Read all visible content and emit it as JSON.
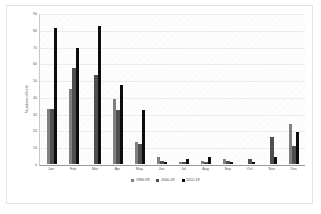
{
  "chart_data": {
    "type": "bar",
    "title": "",
    "xlabel": "",
    "ylabel": "Numbers of birth",
    "ylim": [
      0,
      90
    ],
    "yticks": [
      0,
      10,
      20,
      30,
      40,
      50,
      60,
      70,
      80,
      90
    ],
    "grid": true,
    "legend_position": "bottom",
    "categories": [
      "Jan",
      "Feb",
      "Mar",
      "Apr",
      "May",
      "Jun",
      "Jul",
      "Aug",
      "Sep",
      "Oct",
      "Nov",
      "Dec"
    ],
    "series": [
      {
        "name": "1990-99",
        "color": "#808080",
        "values": [
          33,
          45,
          0,
          39,
          13,
          4,
          1,
          2,
          3,
          0,
          0,
          24
        ]
      },
      {
        "name": "2000-09",
        "color": "#4f4f4f",
        "values": [
          33,
          57,
          53,
          32,
          12,
          2,
          1,
          1,
          2,
          3,
          16,
          11
        ]
      },
      {
        "name": "2010-19",
        "color": "#0d0d0d",
        "values": [
          81,
          69,
          82,
          47,
          32,
          1,
          3,
          4,
          1,
          1,
          4,
          19
        ]
      }
    ]
  }
}
